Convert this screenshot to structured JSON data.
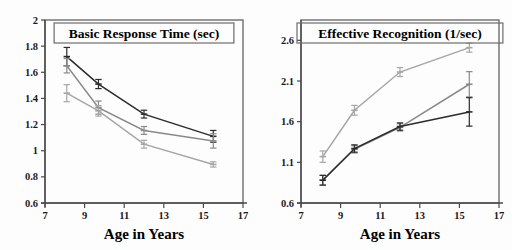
{
  "figure": {
    "background_color": "#fdfdfd",
    "frame_color": "#6d6d6d",
    "axis_color": "#4a4a4a"
  },
  "chart_data": [
    {
      "type": "line",
      "panel": "left",
      "title": "Basic Response Time (sec)",
      "xlabel": "Age in Years",
      "ylabel": "",
      "xlim": [
        7,
        17
      ],
      "ylim": [
        0.6,
        2.0
      ],
      "xticks": [
        7,
        9,
        11,
        13,
        15,
        17
      ],
      "xticklabels": [
        "7",
        "9",
        "11",
        "13",
        "15",
        "17"
      ],
      "yticks": [
        0.6,
        0.8,
        1.0,
        1.2,
        1.4,
        1.6,
        1.8,
        2.0
      ],
      "yticklabels": [
        "0.6",
        "0.8",
        "1",
        "1.2",
        "1.4",
        "1.6",
        "1.8",
        "2"
      ],
      "grid": false,
      "legend": "none",
      "x": [
        8.1,
        9.7,
        12.0,
        15.5
      ],
      "series": [
        {
          "name": "series-dark",
          "color": "#2b2b2b",
          "values": [
            1.72,
            1.51,
            1.28,
            1.11
          ],
          "errors": [
            0.07,
            0.035,
            0.03,
            0.045
          ]
        },
        {
          "name": "series-mid",
          "color": "#8a8a8a",
          "values": [
            1.65,
            1.33,
            1.155,
            1.075
          ],
          "errors": [
            0.055,
            0.05,
            0.03,
            0.055
          ]
        },
        {
          "name": "series-light",
          "color": "#a6a6a6",
          "values": [
            1.44,
            1.305,
            1.05,
            0.895
          ],
          "errors": [
            0.065,
            0.04,
            0.03,
            0.02
          ]
        }
      ]
    },
    {
      "type": "line",
      "panel": "right",
      "title": "Effective Recognition (1/sec)",
      "xlabel": "Age in Years",
      "ylabel": "",
      "xlim": [
        7,
        17
      ],
      "ylim": [
        0.6,
        2.85
      ],
      "xticks": [
        7,
        9,
        11,
        13,
        15,
        17
      ],
      "xticklabels": [
        "7",
        "9",
        "11",
        "13",
        "15",
        "17"
      ],
      "yticks": [
        0.6,
        1.1,
        1.6,
        2.1,
        2.6
      ],
      "yticklabels": [
        "0.6",
        "1.1",
        "1.6",
        "2.1",
        "2.6"
      ],
      "grid": false,
      "legend": "none",
      "x": [
        8.1,
        9.7,
        12.0,
        15.5
      ],
      "series": [
        {
          "name": "series-light",
          "color": "#a6a6a6",
          "values": [
            1.17,
            1.74,
            2.21,
            2.51
          ],
          "errors": [
            0.07,
            0.06,
            0.055,
            0.055
          ]
        },
        {
          "name": "series-mid",
          "color": "#8a8a8a",
          "values": [
            0.88,
            1.26,
            1.53,
            2.06
          ],
          "errors": [
            0.06,
            0.045,
            0.045,
            0.155
          ]
        },
        {
          "name": "series-dark",
          "color": "#2b2b2b",
          "values": [
            0.88,
            1.27,
            1.54,
            1.72
          ],
          "errors": [
            0.06,
            0.045,
            0.045,
            0.175
          ]
        }
      ]
    }
  ]
}
